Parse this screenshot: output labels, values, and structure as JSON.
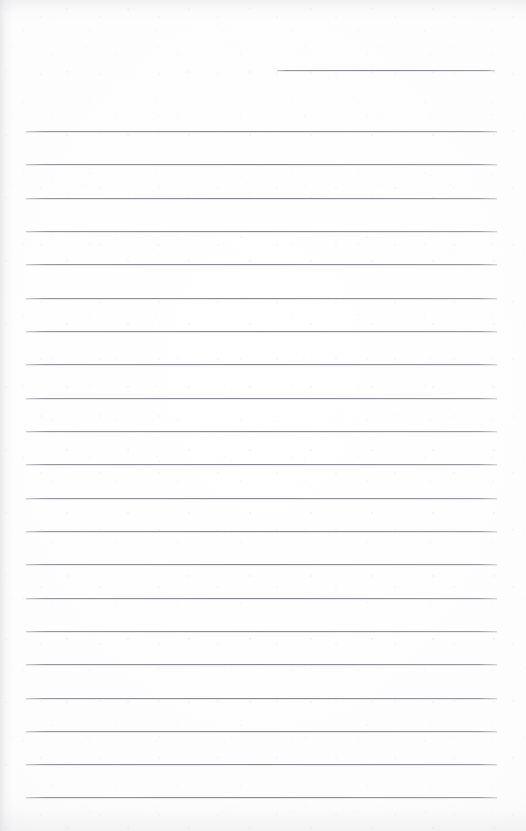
{
  "document": {
    "type": "lined-notepad-page",
    "title": "Blank ruled paper page",
    "page_width": 526,
    "page_height": 831,
    "background_color": "#fefefe",
    "rule_color": "#888b93",
    "rule_thickness_px": 1,
    "text_content": "",
    "handwriting_present": "false",
    "printed_text_present": "false"
  },
  "rules": {
    "header_rule": {
      "label": "header-rule",
      "x_start": 277,
      "x_end": 495,
      "y": 70,
      "width": 218
    },
    "body_rules": {
      "label": "body-ruled-lines",
      "count": 21,
      "x_start": 26,
      "x_end": 497,
      "width": 471,
      "y_first": 131,
      "y_last": 797,
      "spacing": 33.3,
      "lines": [
        {
          "index": 1,
          "y": 131
        },
        {
          "index": 2,
          "y": 164
        },
        {
          "index": 3,
          "y": 198
        },
        {
          "index": 4,
          "y": 231
        },
        {
          "index": 5,
          "y": 264
        },
        {
          "index": 6,
          "y": 298
        },
        {
          "index": 7,
          "y": 331
        },
        {
          "index": 8,
          "y": 364
        },
        {
          "index": 9,
          "y": 398
        },
        {
          "index": 10,
          "y": 431
        },
        {
          "index": 11,
          "y": 464
        },
        {
          "index": 12,
          "y": 498
        },
        {
          "index": 13,
          "y": 531
        },
        {
          "index": 14,
          "y": 564
        },
        {
          "index": 15,
          "y": 598
        },
        {
          "index": 16,
          "y": 631
        },
        {
          "index": 17,
          "y": 664
        },
        {
          "index": 18,
          "y": 698
        },
        {
          "index": 19,
          "y": 731
        },
        {
          "index": 20,
          "y": 764
        },
        {
          "index": 21,
          "y": 797
        }
      ]
    }
  }
}
